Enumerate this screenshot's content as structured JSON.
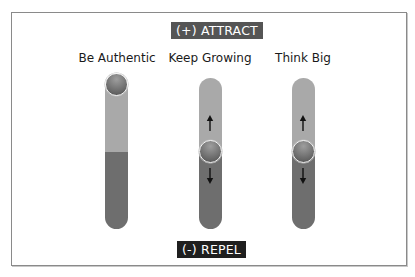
{
  "diagram": {
    "top_label": "(+) ATTRACT",
    "bottom_label": "(-) REPEL",
    "colors": {
      "attract_badge": "#555555",
      "repel_badge": "#1f1f1f",
      "track_upper": "#a9a9a9",
      "track_lower": "#6e6e6e",
      "knob": "#6a6a6a"
    },
    "sliders": [
      {
        "label": "Be Authentic",
        "knob_position": "top",
        "arrows": []
      },
      {
        "label": "Keep Growing",
        "knob_position": "middle",
        "arrows": [
          "up-arrow",
          "down-arrow"
        ]
      },
      {
        "label": "Think Big",
        "knob_position": "middle",
        "arrows": [
          "up-arrow",
          "down-arrow"
        ]
      }
    ]
  }
}
